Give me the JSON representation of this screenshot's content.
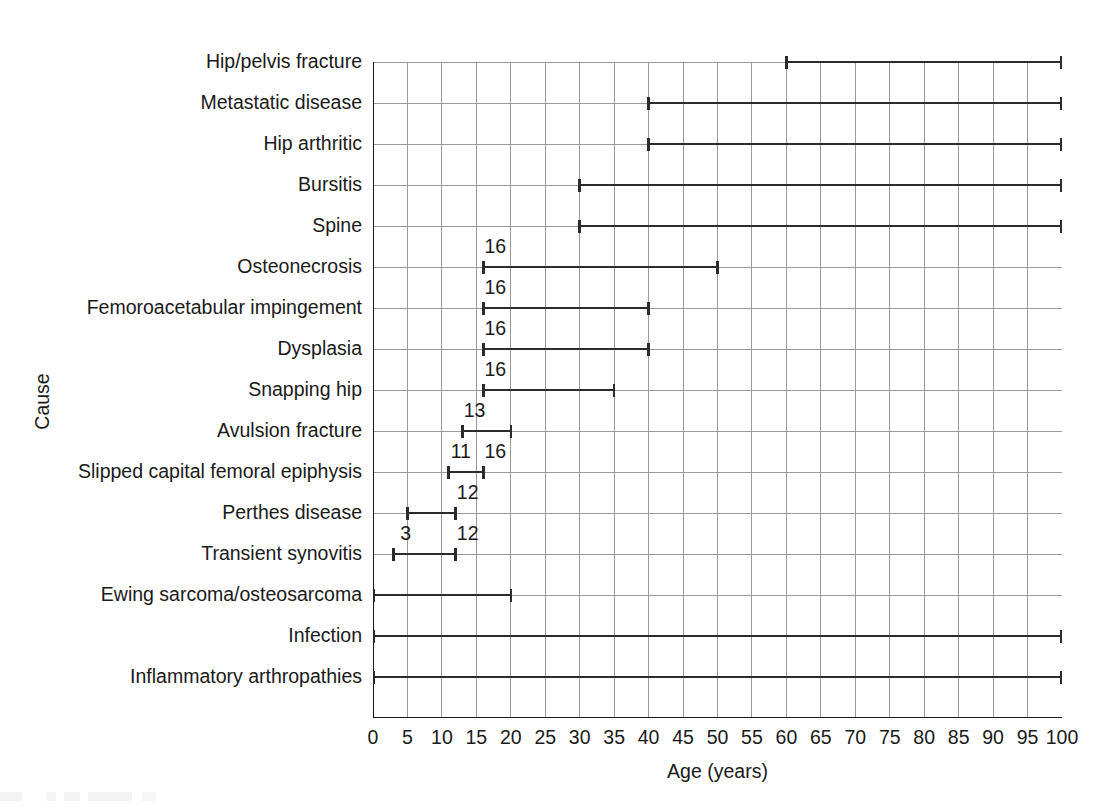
{
  "chart_data": {
    "type": "bar",
    "subtype": "range-bar",
    "title": "",
    "xlabel": "Age (years)",
    "ylabel": "Cause",
    "xlim": [
      0,
      100
    ],
    "xticks": [
      0,
      5,
      10,
      15,
      20,
      25,
      30,
      35,
      40,
      45,
      50,
      55,
      60,
      65,
      70,
      75,
      80,
      85,
      90,
      95,
      100
    ],
    "grid": true,
    "legend": null,
    "categories": [
      "Hip/pelvis fracture",
      "Metastatic disease",
      "Hip arthritic",
      "Bursitis",
      "Spine",
      "Osteonecrosis",
      "Femoroacetabular impingement",
      "Dysplasia",
      "Snapping hip",
      "Avulsion fracture",
      "Slipped capital femoral epiphysis",
      "Perthes disease",
      "Transient synovitis",
      "Ewing sarcoma/osteosarcoma",
      "Infection",
      "Inflammatory arthropathies"
    ],
    "ranges": [
      {
        "category": "Hip/pelvis fracture",
        "start": 60,
        "end": 100,
        "start_label": "",
        "end_label": ""
      },
      {
        "category": "Metastatic disease",
        "start": 40,
        "end": 100,
        "start_label": "",
        "end_label": ""
      },
      {
        "category": "Hip arthritic",
        "start": 40,
        "end": 100,
        "start_label": "",
        "end_label": ""
      },
      {
        "category": "Bursitis",
        "start": 30,
        "end": 100,
        "start_label": "",
        "end_label": ""
      },
      {
        "category": "Spine",
        "start": 30,
        "end": 100,
        "start_label": "",
        "end_label": ""
      },
      {
        "category": "Osteonecrosis",
        "start": 16,
        "end": 50,
        "start_label": "16",
        "end_label": ""
      },
      {
        "category": "Femoroacetabular impingement",
        "start": 16,
        "end": 40,
        "start_label": "16",
        "end_label": ""
      },
      {
        "category": "Dysplasia",
        "start": 16,
        "end": 40,
        "start_label": "16",
        "end_label": ""
      },
      {
        "category": "Snapping hip",
        "start": 16,
        "end": 35,
        "start_label": "16",
        "end_label": ""
      },
      {
        "category": "Avulsion fracture",
        "start": 13,
        "end": 20,
        "start_label": "13",
        "end_label": ""
      },
      {
        "category": "Slipped capital femoral epiphysis",
        "start": 11,
        "end": 16,
        "start_label": "11",
        "end_label": "16"
      },
      {
        "category": "Perthes disease",
        "start": 5,
        "end": 12,
        "start_label": "",
        "end_label": "12"
      },
      {
        "category": "Transient synovitis",
        "start": 3,
        "end": 12,
        "start_label": "3",
        "end_label": "12"
      },
      {
        "category": "Ewing sarcoma/osteosarcoma",
        "start": 0,
        "end": 20,
        "start_label": "",
        "end_label": ""
      },
      {
        "category": "Infection",
        "start": 0,
        "end": 100,
        "start_label": "",
        "end_label": ""
      },
      {
        "category": "Inflammatory arthropathies",
        "start": 0,
        "end": 100,
        "start_label": "",
        "end_label": ""
      }
    ]
  },
  "colors": {
    "bar": "#2b2b2b",
    "grid": "#9a9a9a",
    "axis": "#1a1a1a",
    "text": "#1a1a1a",
    "background": "#ffffff"
  }
}
